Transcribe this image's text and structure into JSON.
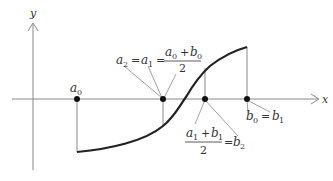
{
  "diagram": {
    "axes": {
      "x_label": "x",
      "y_label": "y"
    },
    "points": [
      {
        "id": "a0",
        "label": "a",
        "sub": "0"
      },
      {
        "id": "a1",
        "label": "a₂ = a₁ = (a₀ + b₀)/2"
      },
      {
        "id": "b2",
        "label": "(a₁ + b₁)/2 = b₂"
      },
      {
        "id": "b0",
        "label": "b₀ = b₁"
      }
    ],
    "labels": {
      "a0": {
        "var": "a",
        "sub": "0"
      },
      "a2a1_lhs": {
        "a2": "a",
        "a2_sub": "2",
        "eq1": "=",
        "a1": "a",
        "a1_sub": "1",
        "eq2": "="
      },
      "a0b0_frac": {
        "num_a": "a",
        "num_a_sub": "0",
        "plus": "+",
        "num_b": "b",
        "num_b_sub": "0",
        "den": "2"
      },
      "b0b1": {
        "b0": "b",
        "b0_sub": "0",
        "eq": "=",
        "b1": "b",
        "b1_sub": "1"
      },
      "a1b1_frac": {
        "num_a": "a",
        "num_a_sub": "1",
        "plus": "+",
        "num_b": "b",
        "num_b_sub": "1",
        "den": "2",
        "eq": "=",
        "b2": "b",
        "b2_sub": "2"
      }
    },
    "colors": {
      "axis": "#888888",
      "curve": "#222222",
      "point": "#111111",
      "text": "#333333"
    }
  }
}
